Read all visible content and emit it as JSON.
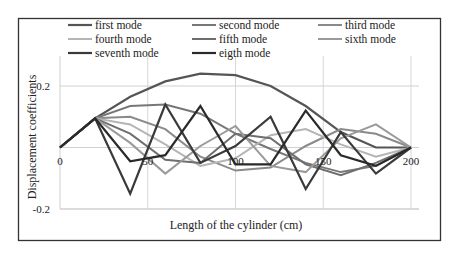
{
  "chart_data": {
    "type": "line",
    "title": "",
    "xlabel": "Length of the cylinder (cm)",
    "ylabel": "Displacement coefficients",
    "xlim": [
      0,
      200
    ],
    "ylim": [
      -0.2,
      0.2
    ],
    "x_ticks": [
      "0",
      "50",
      "100",
      "150",
      "200"
    ],
    "y_ticks": [
      "0.2",
      "0",
      "-0.2"
    ],
    "grid": true,
    "legend_position": "top-inside",
    "x": [
      0,
      20,
      40,
      60,
      80,
      100,
      120,
      140,
      160,
      180,
      200
    ],
    "series": [
      {
        "name": "first mode",
        "color": "#555555",
        "width": 2.2,
        "values": [
          0,
          0.095,
          0.165,
          0.215,
          0.24,
          0.235,
          0.2,
          0.135,
          0.05,
          0.0,
          0
        ]
      },
      {
        "name": "second mode",
        "color": "#777777",
        "width": 2.0,
        "values": [
          0,
          0.095,
          0.135,
          0.14,
          0.11,
          0.045,
          -0.005,
          -0.05,
          -0.08,
          -0.06,
          0
        ]
      },
      {
        "name": "third mode",
        "color": "#8a8a8a",
        "width": 2.0,
        "values": [
          0,
          0.095,
          0.1,
          0.06,
          -0.03,
          -0.075,
          -0.065,
          0.005,
          0.06,
          0.045,
          0
        ]
      },
      {
        "name": "fourth mode",
        "color": "#b5b5b5",
        "width": 2.0,
        "values": [
          0,
          0.095,
          0.075,
          0.01,
          -0.06,
          -0.035,
          0.04,
          0.06,
          0.01,
          -0.03,
          0
        ]
      },
      {
        "name": "fifth mode",
        "color": "#6e6e6e",
        "width": 2.0,
        "values": [
          0,
          0.095,
          0.045,
          -0.04,
          -0.05,
          0.045,
          0.03,
          -0.055,
          -0.09,
          -0.05,
          0
        ]
      },
      {
        "name": "sixth mode",
        "color": "#9a9a9a",
        "width": 2.0,
        "values": [
          0,
          0.095,
          0.015,
          -0.085,
          0.005,
          0.07,
          -0.06,
          -0.08,
          0.03,
          0.075,
          0
        ]
      },
      {
        "name": "seventh mode",
        "color": "#3a3a3a",
        "width": 2.2,
        "values": [
          0,
          0.095,
          -0.15,
          0.14,
          -0.05,
          0.005,
          0.1,
          -0.135,
          0.05,
          -0.085,
          0
        ]
      },
      {
        "name": "eigth mode",
        "color": "#2a2a2a",
        "width": 2.2,
        "values": [
          0,
          0.095,
          -0.045,
          -0.025,
          0.135,
          -0.055,
          -0.055,
          0.12,
          -0.025,
          -0.06,
          0
        ]
      }
    ]
  },
  "legend": {
    "items": [
      {
        "label": "first mode"
      },
      {
        "label": "second mode"
      },
      {
        "label": "third mode"
      },
      {
        "label": "fourth mode"
      },
      {
        "label": "fifth mode"
      },
      {
        "label": "sixth mode"
      },
      {
        "label": "seventh mode"
      },
      {
        "label": "eigth mode"
      }
    ]
  },
  "axes": {
    "xlabel": "Length of the cylinder (cm)",
    "ylabel": "Displacement coefficients",
    "x_ticks": [
      "0",
      "50",
      "100",
      "150",
      "200"
    ],
    "y_ticks": [
      "0.2",
      "0",
      "-0.2"
    ]
  }
}
